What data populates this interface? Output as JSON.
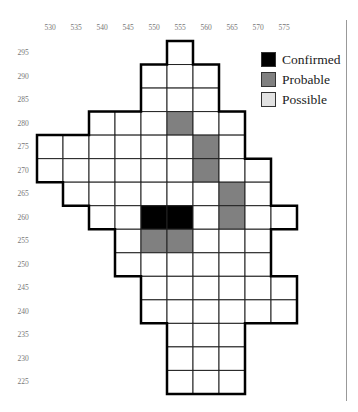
{
  "map": {
    "type": "grid atlas map",
    "columns": [
      "530",
      "535",
      "540",
      "545",
      "550",
      "555",
      "560",
      "565",
      "570",
      "575"
    ],
    "rows": [
      "295",
      "290",
      "285",
      "280",
      "275",
      "270",
      "265",
      "260",
      "255",
      "250",
      "245",
      "240",
      "235",
      "230",
      "225"
    ],
    "row_ranges": {
      "295": [
        "555",
        "555"
      ],
      "290": [
        "550",
        "560"
      ],
      "285": [
        "550",
        "560"
      ],
      "280": [
        "540",
        "565"
      ],
      "275": [
        "530",
        "565"
      ],
      "270": [
        "530",
        "570"
      ],
      "265": [
        "535",
        "570"
      ],
      "260": [
        "540",
        "575"
      ],
      "255": [
        "545",
        "570"
      ],
      "250": [
        "545",
        "570"
      ],
      "245": [
        "550",
        "575"
      ],
      "240": [
        "550",
        "575"
      ],
      "235": [
        "555",
        "565"
      ],
      "230": [
        "555",
        "565"
      ],
      "225": [
        "555",
        "565"
      ]
    },
    "records": [
      {
        "col": "550",
        "row": "260",
        "status": "Confirmed"
      },
      {
        "col": "555",
        "row": "260",
        "status": "Confirmed"
      },
      {
        "col": "555",
        "row": "280",
        "status": "Probable"
      },
      {
        "col": "560",
        "row": "275",
        "status": "Probable"
      },
      {
        "col": "560",
        "row": "270",
        "status": "Probable"
      },
      {
        "col": "565",
        "row": "265",
        "status": "Probable"
      },
      {
        "col": "565",
        "row": "260",
        "status": "Probable"
      },
      {
        "col": "550",
        "row": "255",
        "status": "Probable"
      },
      {
        "col": "555",
        "row": "255",
        "status": "Probable"
      }
    ]
  },
  "legend": {
    "items": [
      {
        "label": "Confirmed",
        "color": "#000000"
      },
      {
        "label": "Probable",
        "color": "#808080"
      },
      {
        "label": "Possible",
        "color": "#e2e2e2"
      }
    ]
  },
  "colors": {
    "empty_cell": "#ffffff",
    "grid_line": "#222222",
    "outline": "#000000",
    "tick_label": "#777777"
  }
}
